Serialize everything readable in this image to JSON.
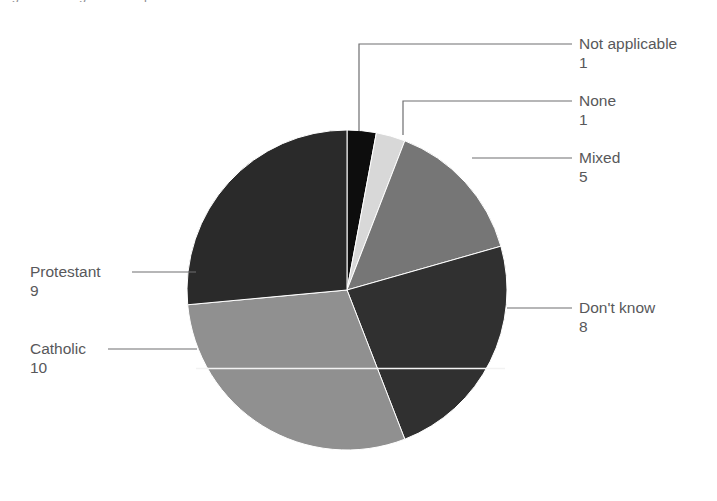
{
  "figure": {
    "cropped_header_text": "Figure 6 Religion of respondents",
    "background_color": "#ffffff",
    "text_color": "#58585a",
    "leader_line_color": "#6e6e70"
  },
  "chart_data": {
    "type": "pie",
    "title": "",
    "xlabel": "",
    "ylabel": "",
    "total": 34,
    "units": "respondents",
    "grid": false,
    "legend_position": "callout-labels",
    "start_angle_deg": 0,
    "direction": "clockwise",
    "center": {
      "x": 347,
      "y": 290
    },
    "radius": 160,
    "categories": [
      "Not applicable",
      "None",
      "Mixed",
      "Don't know",
      "Catholic",
      "Protestant"
    ],
    "values": [
      1,
      1,
      5,
      8,
      10,
      9
    ],
    "colors": [
      "#0d0d0d",
      "#d8d8d8",
      "#767676",
      "#303030",
      "#909090",
      "#2a2a2a"
    ],
    "slices": [
      {
        "label": "Not applicable",
        "value": 1,
        "value_text": "1",
        "color": "#0d0d0d",
        "start_deg": 0,
        "end_deg": 10.588,
        "label_position": "right-top",
        "leader": "elbow"
      },
      {
        "label": "None",
        "value": 1,
        "value_text": "1",
        "color": "#d8d8d8",
        "start_deg": 10.588,
        "end_deg": 21.176,
        "label_position": "right-top",
        "leader": "elbow"
      },
      {
        "label": "Mixed",
        "value": 5,
        "value_text": "5",
        "color": "#767676",
        "start_deg": 21.176,
        "end_deg": 74.118,
        "label_position": "right",
        "leader": "straight"
      },
      {
        "label": "Don't know",
        "value": 8,
        "value_text": "8",
        "color": "#303030",
        "start_deg": 74.118,
        "end_deg": 158.824,
        "label_position": "right",
        "leader": "straight"
      },
      {
        "label": "Catholic",
        "value": 10,
        "value_text": "10",
        "color": "#909090",
        "start_deg": 158.824,
        "end_deg": 264.706,
        "label_position": "left",
        "leader": "straight"
      },
      {
        "label": "Protestant",
        "value": 9,
        "value_text": "9",
        "color": "#2a2a2a",
        "start_deg": 264.706,
        "end_deg": 360,
        "label_position": "left",
        "leader": "straight"
      }
    ]
  },
  "labels": {
    "not_applicable": {
      "name": "Not applicable",
      "value": "1"
    },
    "none": {
      "name": "None",
      "value": "1"
    },
    "mixed": {
      "name": "Mixed",
      "value": "5"
    },
    "dont_know": {
      "name": "Don't know",
      "value": "8"
    },
    "catholic": {
      "name": "Catholic",
      "value": "10"
    },
    "protestant": {
      "name": "Protestant",
      "value": "9"
    }
  }
}
